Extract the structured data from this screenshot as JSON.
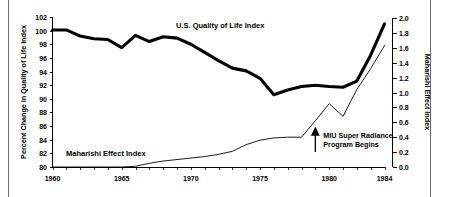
{
  "chart_data": {
    "type": "line",
    "title": "",
    "subtitle": "",
    "xlabel": "",
    "x_tick_labels": [
      "1960",
      "1965",
      "1970",
      "1975",
      "1980",
      "1984"
    ],
    "x_tick_values": [
      1960,
      1965,
      1970,
      1975,
      1980,
      1984
    ],
    "xlim": [
      1960,
      1984
    ],
    "x_minor_tick_step": 1,
    "grid": false,
    "legend_position": "inline-labels",
    "axes": {
      "left": {
        "label": "Percent Change in Quality of Life Index",
        "min": 80,
        "max": 102,
        "step": 2,
        "tick_labels": [
          "80",
          "82",
          "84",
          "86",
          "88",
          "90",
          "92",
          "94",
          "96",
          "98",
          "100",
          "102"
        ]
      },
      "right": {
        "label": "Maharishi Effect Index",
        "min": 0.0,
        "max": 2.0,
        "step": 0.2,
        "tick_labels": [
          "0.0",
          "0.2",
          "0.4",
          "0.6",
          "0.8",
          "1.0",
          "1.2",
          "1.4",
          "1.6",
          "1.8",
          "2.0"
        ]
      }
    },
    "x": [
      1960,
      1961,
      1962,
      1963,
      1964,
      1965,
      1966,
      1967,
      1968,
      1969,
      1970,
      1971,
      1972,
      1973,
      1974,
      1975,
      1976,
      1977,
      1978,
      1979,
      1980,
      1981,
      1982,
      1983,
      1984
    ],
    "series": [
      {
        "name": "U.S. Quality of Life Index",
        "axis": "left",
        "style": "thick",
        "values": [
          100.1,
          100.1,
          99.2,
          98.8,
          98.7,
          97.5,
          99.3,
          98.4,
          99.1,
          98.9,
          98.0,
          96.8,
          95.6,
          94.5,
          94.1,
          93.0,
          90.6,
          91.3,
          91.8,
          92.0,
          91.8,
          91.7,
          92.6,
          96.4,
          101.0
        ]
      },
      {
        "name": "Maharishi Effect Index",
        "axis": "right",
        "style": "thin",
        "values": [
          0.0,
          0.0,
          0.0,
          0.0,
          0.0,
          0.0,
          0.01,
          0.05,
          0.08,
          0.1,
          0.12,
          0.14,
          0.17,
          0.21,
          0.3,
          0.36,
          0.39,
          0.4,
          0.4,
          0.62,
          0.85,
          0.68,
          1.04,
          1.32,
          1.63
        ]
      }
    ],
    "annotations": [
      {
        "name": "miu-super-radiance",
        "text_line1": "MIU Super Radiance",
        "text_line2": "Program Begins",
        "arrow_x": 1979,
        "arrow_direction": "up"
      }
    ],
    "series_inline_labels": [
      {
        "name": "us-quality-of-life",
        "text": "U.S. Quality of Life Index"
      },
      {
        "name": "maharishi-effect",
        "text": "Maharishi Effect Index"
      }
    ]
  },
  "colors": {
    "background": "#ffffff",
    "ink": "#000000",
    "frame_rule": "#6e6e6e"
  }
}
